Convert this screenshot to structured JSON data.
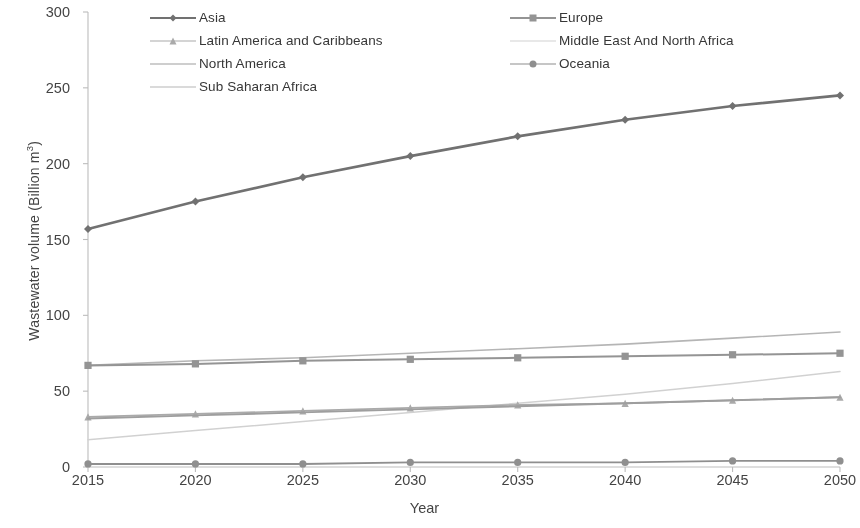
{
  "axes": {
    "x_title": "Year",
    "y_title_main": "Wastewater volume (Billion m",
    "y_title_sup": "3",
    "y_title_tail": ")",
    "y_ticks": [
      "0",
      "50",
      "100",
      "150",
      "200",
      "250",
      "300"
    ],
    "x_ticks": [
      "2015",
      "2020",
      "2025",
      "2030",
      "2035",
      "2040",
      "2045",
      "2050"
    ]
  },
  "legend": {
    "items": [
      {
        "label": "Asia",
        "color": "#6b6b6b",
        "marker": "diamond",
        "width": 2.6,
        "column": 0,
        "row": 0
      },
      {
        "label": "Europe",
        "color": "#8f8f8f",
        "marker": "square",
        "width": 2.0,
        "column": 1,
        "row": 0
      },
      {
        "label": "Latin America and Caribbeans",
        "color": "#a6a6a6",
        "marker": "triangle",
        "width": 1.7,
        "column": 0,
        "row": 1
      },
      {
        "label": "Middle East And North Africa",
        "color": "#cfcfcf",
        "marker": "none",
        "width": 1.5,
        "column": 1,
        "row": 1
      },
      {
        "label": "North America",
        "color": "#9a9a9a",
        "marker": "none",
        "width": 1.9,
        "column": 0,
        "row": 2
      },
      {
        "label": "Oceania",
        "color": "#8a8a8a",
        "marker": "circle",
        "width": 1.9,
        "column": 1,
        "row": 2
      },
      {
        "label": "Sub Saharan Africa",
        "color": "#b2b2b2",
        "marker": "none",
        "width": 1.6,
        "column": 0,
        "row": 3
      }
    ]
  },
  "chart_data": {
    "type": "line",
    "title": "",
    "xlabel": "Year",
    "ylabel": "Wastewater volume (Billion m3)",
    "x": [
      2015,
      2020,
      2025,
      2030,
      2035,
      2040,
      2045,
      2050
    ],
    "xlim": [
      2015,
      2050
    ],
    "ylim": [
      0,
      300
    ],
    "ytick_step": 50,
    "grid": false,
    "legend_position": "top",
    "series": [
      {
        "name": "Asia",
        "values": [
          157,
          175,
          191,
          205,
          218,
          229,
          238,
          245
        ]
      },
      {
        "name": "Europe",
        "values": [
          67,
          68,
          70,
          71,
          72,
          73,
          74,
          75
        ]
      },
      {
        "name": "Latin America and Caribbeans",
        "values": [
          33,
          35,
          37,
          39,
          41,
          42,
          44,
          46
        ]
      },
      {
        "name": "Middle East And North Africa",
        "values": [
          18,
          24,
          30,
          36,
          42,
          48,
          55,
          63
        ]
      },
      {
        "name": "North America",
        "values": [
          32,
          34,
          36,
          38,
          40,
          42,
          44,
          46
        ]
      },
      {
        "name": "Oceania",
        "values": [
          2,
          2,
          2,
          3,
          3,
          3,
          4,
          4
        ]
      },
      {
        "name": "Sub Saharan Africa",
        "values": [
          67,
          70,
          72,
          75,
          78,
          81,
          85,
          89
        ]
      }
    ]
  },
  "plot_geometry": {
    "left": 88,
    "right": 840,
    "top": 12,
    "bottom": 467
  }
}
